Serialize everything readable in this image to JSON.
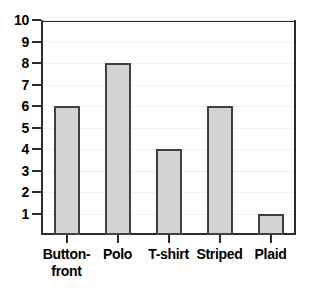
{
  "chart_data": {
    "type": "bar",
    "title": "",
    "subtitle": "",
    "xlabel": "",
    "ylabel": "",
    "categories": [
      "Button-front",
      "Polo",
      "T-shirt",
      "Striped",
      "Plaid"
    ],
    "category_display": [
      "Button-\nfront",
      "Polo",
      "T-shirt",
      "Striped",
      "Plaid"
    ],
    "values": [
      6,
      8,
      4,
      6,
      1
    ],
    "ylim": [
      0,
      10
    ],
    "ytick_labels": [
      "10",
      "9",
      "8",
      "7",
      "6",
      "5",
      "4",
      "3",
      "2",
      "1"
    ],
    "ytick_values": [
      10,
      9,
      8,
      7,
      6,
      5,
      4,
      3,
      2,
      1
    ],
    "grid": true,
    "legend": "none",
    "annotations": []
  },
  "style": {
    "bar_fill": "#d3d3d3",
    "bar_border": "#404040",
    "frame_color": "#2b2b2b",
    "gridline_color": "#f0f0f0",
    "text_color": "#000000",
    "background": "#ffffff"
  }
}
